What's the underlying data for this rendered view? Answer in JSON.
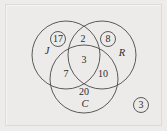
{
  "figure": {
    "kind": "venn-diagram",
    "set_count": 3,
    "background_color": "#edecea",
    "frame_color": "#dcdbd8",
    "stroke_color": "#4a4a4a",
    "text_color": "#2b2b2b"
  },
  "sets": [
    {
      "id": "J",
      "label": "J",
      "label_x": 47,
      "label_y": 52
    },
    {
      "id": "R",
      "label": "R",
      "label_x": 122,
      "label_y": 54
    },
    {
      "id": "C",
      "label": "C",
      "label_x": 85,
      "label_y": 105
    }
  ],
  "circles": [
    {
      "id": "J",
      "cx": 66,
      "cy": 55,
      "r": 34
    },
    {
      "id": "R",
      "cx": 102,
      "cy": 55,
      "r": 34
    },
    {
      "id": "C",
      "cx": 84,
      "cy": 79,
      "r": 34
    }
  ],
  "regions": [
    {
      "id": "J-only",
      "value": "17",
      "x": 58,
      "y": 39,
      "circled": true
    },
    {
      "id": "J-and-R",
      "value": "2",
      "x": 83,
      "y": 39,
      "circled": false
    },
    {
      "id": "R-only",
      "value": "8",
      "x": 108,
      "y": 39,
      "circled": true
    },
    {
      "id": "J-R-C",
      "value": "3",
      "x": 84,
      "y": 60,
      "circled": false
    },
    {
      "id": "J-and-C",
      "value": "7",
      "x": 66,
      "y": 74,
      "circled": false
    },
    {
      "id": "R-and-C",
      "value": "10",
      "x": 103,
      "y": 74,
      "circled": false
    },
    {
      "id": "C-only",
      "value": "20",
      "x": 84,
      "y": 92,
      "circled": false
    },
    {
      "id": "universe",
      "value": "3",
      "x": 141,
      "y": 105,
      "circled": true
    }
  ],
  "mini_circle_radius": 7.5
}
